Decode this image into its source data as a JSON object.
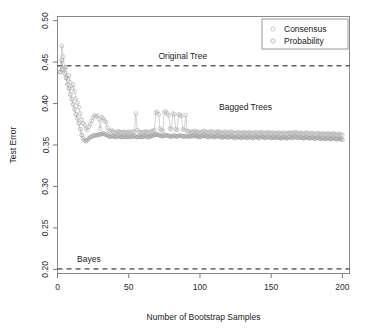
{
  "chart_data": {
    "type": "line",
    "title": "",
    "xlabel": "Number of Bootstrap Samples",
    "ylabel": "Test Error",
    "xlim": [
      0,
      205
    ],
    "ylim": [
      0.195,
      0.505
    ],
    "xticks": [
      0,
      50,
      100,
      150,
      200
    ],
    "xtick_labels": [
      "0",
      "50",
      "100",
      "150",
      "200"
    ],
    "yticks": [
      0.2,
      0.25,
      0.3,
      0.35,
      0.4,
      0.45,
      0.5
    ],
    "ytick_labels": [
      "0.20",
      "0.25",
      "0.30",
      "0.35",
      "0.40",
      "0.45",
      "0.50"
    ],
    "grid": false,
    "legend_position": "top-right",
    "marker": "open-circle",
    "legend": [
      {
        "name": "Consensus",
        "color": "#b4b4b4"
      },
      {
        "name": "Probability",
        "color": "#9a9a9a"
      }
    ],
    "reference_lines": [
      {
        "name": "Original Tree",
        "value": 0.4455,
        "style": "dashed",
        "label": "Original Tree",
        "label_x": 88
      },
      {
        "name": "Bayes",
        "value": 0.2005,
        "style": "dashed",
        "label": "Bayes",
        "label_x": 22
      }
    ],
    "annotations": [
      {
        "text": "Bagged Trees",
        "x": 132,
        "y": 0.392
      }
    ],
    "series": [
      {
        "name": "Consensus",
        "color": "#b4b4b4",
        "x": [
          2,
          3,
          4,
          5,
          6,
          7,
          8,
          9,
          10,
          11,
          12,
          13,
          14,
          15,
          16,
          17,
          18,
          19,
          20,
          21,
          22,
          23,
          24,
          25,
          26,
          27,
          28,
          29,
          30,
          31,
          32,
          33,
          34,
          35,
          36,
          37,
          38,
          39,
          40,
          41,
          42,
          43,
          44,
          45,
          46,
          47,
          48,
          49,
          50,
          51,
          52,
          53,
          54,
          55,
          56,
          57,
          58,
          59,
          60,
          61,
          62,
          63,
          64,
          65,
          66,
          67,
          68,
          69,
          70,
          71,
          72,
          73,
          74,
          75,
          76,
          77,
          78,
          79,
          80,
          81,
          82,
          83,
          84,
          85,
          86,
          87,
          88,
          89,
          90,
          91,
          92,
          93,
          94,
          95,
          96,
          97,
          98,
          99,
          100,
          101,
          102,
          103,
          104,
          105,
          106,
          107,
          108,
          109,
          110,
          111,
          112,
          113,
          114,
          115,
          116,
          117,
          118,
          119,
          120,
          121,
          122,
          123,
          124,
          125,
          126,
          127,
          128,
          129,
          130,
          131,
          132,
          133,
          134,
          135,
          136,
          137,
          138,
          139,
          140,
          141,
          142,
          143,
          144,
          145,
          146,
          147,
          148,
          149,
          150,
          151,
          152,
          153,
          154,
          155,
          156,
          157,
          158,
          159,
          160,
          161,
          162,
          163,
          164,
          165,
          166,
          167,
          168,
          169,
          170,
          171,
          172,
          173,
          174,
          175,
          176,
          177,
          178,
          179,
          180,
          181,
          182,
          183,
          184,
          185,
          186,
          187,
          188,
          189,
          190,
          191,
          192,
          193,
          194,
          195,
          196,
          197,
          198,
          199,
          200
        ],
        "values": [
          0.4385,
          0.4695,
          0.4565,
          0.443,
          0.444,
          0.43,
          0.434,
          0.4255,
          0.4185,
          0.423,
          0.4145,
          0.406,
          0.401,
          0.3955,
          0.388,
          0.3805,
          0.376,
          0.374,
          0.37,
          0.368,
          0.372,
          0.3755,
          0.379,
          0.383,
          0.386,
          0.3845,
          0.3855,
          0.3815,
          0.37,
          0.3835,
          0.3825,
          0.379,
          0.378,
          0.371,
          0.367,
          0.3665,
          0.368,
          0.366,
          0.3655,
          0.365,
          0.366,
          0.3665,
          0.3655,
          0.365,
          0.3655,
          0.366,
          0.365,
          0.3655,
          0.366,
          0.3655,
          0.365,
          0.366,
          0.3665,
          0.388,
          0.368,
          0.366,
          0.3655,
          0.365,
          0.3655,
          0.366,
          0.3665,
          0.3655,
          0.365,
          0.366,
          0.3665,
          0.367,
          0.368,
          0.389,
          0.39,
          0.387,
          0.3695,
          0.368,
          0.367,
          0.3895,
          0.3905,
          0.388,
          0.386,
          0.37,
          0.369,
          0.388,
          0.387,
          0.369,
          0.368,
          0.387,
          0.386,
          0.385,
          0.369,
          0.368,
          0.386,
          0.367,
          0.3665,
          0.366,
          0.3655,
          0.366,
          0.367,
          0.3665,
          0.366,
          0.3655,
          0.365,
          0.3655,
          0.3665,
          0.367,
          0.366,
          0.3655,
          0.365,
          0.366,
          0.3665,
          0.3655,
          0.365,
          0.3655,
          0.366,
          0.3665,
          0.3655,
          0.365,
          0.3645,
          0.3655,
          0.366,
          0.365,
          0.3645,
          0.3655,
          0.366,
          0.365,
          0.3645,
          0.364,
          0.365,
          0.3655,
          0.3645,
          0.364,
          0.365,
          0.3655,
          0.3645,
          0.364,
          0.365,
          0.3655,
          0.3645,
          0.364,
          0.3645,
          0.3655,
          0.365,
          0.364,
          0.3645,
          0.3655,
          0.365,
          0.3645,
          0.364,
          0.365,
          0.3655,
          0.3645,
          0.364,
          0.365,
          0.3645,
          0.364,
          0.3645,
          0.365,
          0.364,
          0.3635,
          0.3645,
          0.365,
          0.364,
          0.3635,
          0.3645,
          0.365,
          0.3645,
          0.364,
          0.365,
          0.3655,
          0.3645,
          0.364,
          0.365,
          0.3645,
          0.364,
          0.3635,
          0.3645,
          0.365,
          0.364,
          0.3635,
          0.364,
          0.3645,
          0.3635,
          0.363,
          0.364,
          0.3645,
          0.3635,
          0.363,
          0.364,
          0.3635,
          0.363,
          0.3635,
          0.364,
          0.363,
          0.3625,
          0.3635,
          0.364,
          0.363,
          0.3625,
          0.363,
          0.3635,
          0.3625,
          0.362
        ]
      },
      {
        "name": "Probability",
        "color": "#9a9a9a",
        "x": [
          2,
          3,
          4,
          5,
          6,
          7,
          8,
          9,
          10,
          11,
          12,
          13,
          14,
          15,
          16,
          17,
          18,
          19,
          20,
          21,
          22,
          23,
          24,
          25,
          26,
          27,
          28,
          29,
          30,
          31,
          32,
          33,
          34,
          35,
          36,
          37,
          38,
          39,
          40,
          41,
          42,
          43,
          44,
          45,
          46,
          47,
          48,
          49,
          50,
          51,
          52,
          53,
          54,
          55,
          56,
          57,
          58,
          59,
          60,
          61,
          62,
          63,
          64,
          65,
          66,
          67,
          68,
          69,
          70,
          71,
          72,
          73,
          74,
          75,
          76,
          77,
          78,
          79,
          80,
          81,
          82,
          83,
          84,
          85,
          86,
          87,
          88,
          89,
          90,
          91,
          92,
          93,
          94,
          95,
          96,
          97,
          98,
          99,
          100,
          101,
          102,
          103,
          104,
          105,
          106,
          107,
          108,
          109,
          110,
          111,
          112,
          113,
          114,
          115,
          116,
          117,
          118,
          119,
          120,
          121,
          122,
          123,
          124,
          125,
          126,
          127,
          128,
          129,
          130,
          131,
          132,
          133,
          134,
          135,
          136,
          137,
          138,
          139,
          140,
          141,
          142,
          143,
          144,
          145,
          146,
          147,
          148,
          149,
          150,
          151,
          152,
          153,
          154,
          155,
          156,
          157,
          158,
          159,
          160,
          161,
          162,
          163,
          164,
          165,
          166,
          167,
          168,
          169,
          170,
          171,
          172,
          173,
          174,
          175,
          176,
          177,
          178,
          179,
          180,
          181,
          182,
          183,
          184,
          185,
          186,
          187,
          188,
          189,
          190,
          191,
          192,
          193,
          194,
          195,
          196,
          197,
          198,
          199,
          200
        ],
        "values": [
          0.438,
          0.452,
          0.441,
          0.4365,
          0.431,
          0.423,
          0.418,
          0.411,
          0.405,
          0.399,
          0.393,
          0.387,
          0.382,
          0.376,
          0.369,
          0.362,
          0.358,
          0.3555,
          0.3545,
          0.356,
          0.358,
          0.3595,
          0.36,
          0.361,
          0.362,
          0.3615,
          0.362,
          0.363,
          0.3625,
          0.3635,
          0.364,
          0.363,
          0.3625,
          0.3615,
          0.3605,
          0.36,
          0.361,
          0.3605,
          0.36,
          0.3595,
          0.3605,
          0.361,
          0.36,
          0.3595,
          0.36,
          0.3605,
          0.3595,
          0.36,
          0.3605,
          0.36,
          0.3595,
          0.3605,
          0.361,
          0.36,
          0.3595,
          0.36,
          0.3605,
          0.3595,
          0.36,
          0.3605,
          0.361,
          0.36,
          0.3595,
          0.3605,
          0.361,
          0.3615,
          0.362,
          0.3625,
          0.363,
          0.362,
          0.3615,
          0.361,
          0.3605,
          0.3615,
          0.362,
          0.3615,
          0.361,
          0.3605,
          0.36,
          0.361,
          0.3615,
          0.3605,
          0.36,
          0.361,
          0.3615,
          0.361,
          0.3605,
          0.36,
          0.361,
          0.3605,
          0.36,
          0.3605,
          0.361,
          0.3605,
          0.3615,
          0.361,
          0.3605,
          0.36,
          0.3595,
          0.3605,
          0.361,
          0.3615,
          0.3605,
          0.36,
          0.3595,
          0.3605,
          0.361,
          0.36,
          0.3595,
          0.36,
          0.3605,
          0.361,
          0.36,
          0.3595,
          0.359,
          0.36,
          0.3605,
          0.3595,
          0.359,
          0.36,
          0.3605,
          0.3595,
          0.359,
          0.3585,
          0.3595,
          0.36,
          0.359,
          0.3585,
          0.3595,
          0.36,
          0.359,
          0.3585,
          0.3595,
          0.36,
          0.359,
          0.3585,
          0.359,
          0.36,
          0.3595,
          0.3585,
          0.359,
          0.36,
          0.3595,
          0.359,
          0.3585,
          0.3595,
          0.36,
          0.359,
          0.3585,
          0.3595,
          0.359,
          0.3585,
          0.359,
          0.3595,
          0.3585,
          0.358,
          0.359,
          0.3595,
          0.3585,
          0.358,
          0.359,
          0.3595,
          0.359,
          0.3585,
          0.3595,
          0.36,
          0.359,
          0.3585,
          0.3595,
          0.359,
          0.3585,
          0.358,
          0.359,
          0.3595,
          0.3585,
          0.358,
          0.3585,
          0.359,
          0.358,
          0.3575,
          0.3585,
          0.359,
          0.358,
          0.3575,
          0.3585,
          0.358,
          0.3575,
          0.358,
          0.3585,
          0.3575,
          0.357,
          0.358,
          0.3585,
          0.3575,
          0.357,
          0.3575,
          0.358,
          0.357,
          0.3565
        ]
      }
    ]
  }
}
